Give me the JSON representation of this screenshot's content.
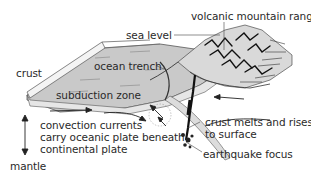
{
  "diagram": {
    "labels": {
      "sea_level": "sea level",
      "volcanic_mountain_range": "volcanic mountain range",
      "crust": "crust",
      "ocean_trench": "ocean trench",
      "subduction_zone": "subduction zone",
      "convection_line1": "convection currents",
      "convection_line2": "carry oceanic plate beneath",
      "convection_line3": "continental plate",
      "mantle": "mantle",
      "crust_melts_line1": "crust melts and rises",
      "crust_melts_line2": "to surface",
      "earthquake_focus": "earthquake focus"
    },
    "colors": {
      "ocean_surface": "#c8c8c8",
      "crust_edge": "#f2f2f2",
      "ink": "#1a1a1a",
      "text": "#2a2a2a",
      "background": "#ffffff"
    }
  }
}
